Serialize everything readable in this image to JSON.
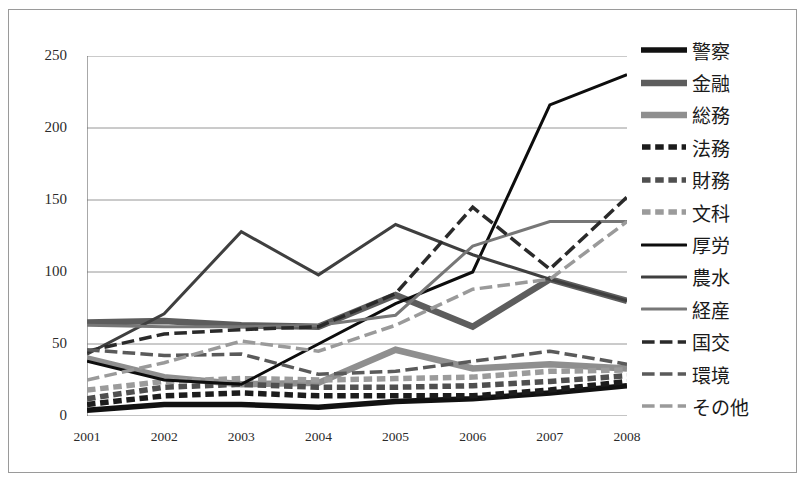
{
  "chart_data": {
    "type": "line",
    "title": "",
    "xlabel": "",
    "ylabel": "",
    "categories": [
      "2001",
      "2002",
      "2003",
      "2004",
      "2005",
      "2006",
      "2007",
      "2008"
    ],
    "ylim": [
      0,
      250
    ],
    "yticks": [
      0,
      50,
      100,
      150,
      200,
      250
    ],
    "grid": true,
    "legend_position": "right",
    "series": [
      {
        "name": "警察",
        "values": [
          4,
          8,
          8,
          6,
          10,
          12,
          16,
          21
        ],
        "color": "#111111",
        "width": 5.5,
        "dash": "solid"
      },
      {
        "name": "金融",
        "values": [
          65,
          66,
          63,
          62,
          84,
          62,
          95,
          80
        ],
        "color": "#5d5d5d",
        "width": 6.5,
        "dash": "solid"
      },
      {
        "name": "総務",
        "values": [
          40,
          27,
          22,
          23,
          46,
          33,
          36,
          33
        ],
        "color": "#8f8f8f",
        "width": 6.5,
        "dash": "solid"
      },
      {
        "name": "法務",
        "values": [
          8,
          14,
          16,
          14,
          14,
          14,
          18,
          24
        ],
        "color": "#1c1c1c",
        "width": 5.5,
        "dash": "dashed"
      },
      {
        "name": "財務",
        "values": [
          12,
          20,
          22,
          20,
          20,
          21,
          24,
          28
        ],
        "color": "#4f4f4f",
        "width": 5.5,
        "dash": "dashed"
      },
      {
        "name": "文科",
        "values": [
          18,
          24,
          26,
          25,
          26,
          27,
          31,
          32
        ],
        "color": "#9b9b9b",
        "width": 5.5,
        "dash": "dashed"
      },
      {
        "name": "厚労",
        "values": [
          38,
          25,
          22,
          50,
          78,
          100,
          216,
          237
        ],
        "color": "#0d0d0d",
        "width": 3.0,
        "dash": "solid"
      },
      {
        "name": "農水",
        "values": [
          43,
          71,
          128,
          98,
          133,
          112,
          95,
          80
        ],
        "color": "#3f3f3f",
        "width": 3.0,
        "dash": "solid"
      },
      {
        "name": "経産",
        "values": [
          63,
          62,
          62,
          63,
          70,
          118,
          135,
          135
        ],
        "color": "#777777",
        "width": 3.0,
        "dash": "solid"
      },
      {
        "name": "国交",
        "values": [
          45,
          57,
          60,
          62,
          85,
          145,
          102,
          152
        ],
        "color": "#2a2a2a",
        "width": 3.5,
        "dash": "longdash"
      },
      {
        "name": "環境",
        "values": [
          46,
          42,
          43,
          29,
          31,
          38,
          45,
          36
        ],
        "color": "#5a5a5a",
        "width": 3.5,
        "dash": "longdash"
      },
      {
        "name": "その他",
        "values": [
          25,
          37,
          52,
          45,
          63,
          88,
          95,
          135
        ],
        "color": "#9a9a9a",
        "width": 3.5,
        "dash": "longdash"
      }
    ]
  },
  "legend": {
    "items": [
      {
        "label": "警察"
      },
      {
        "label": "金融"
      },
      {
        "label": "総務"
      },
      {
        "label": "法務"
      },
      {
        "label": "財務"
      },
      {
        "label": "文科"
      },
      {
        "label": "厚労"
      },
      {
        "label": "農水"
      },
      {
        "label": "経産"
      },
      {
        "label": "国交"
      },
      {
        "label": "環境"
      },
      {
        "label": "その他"
      }
    ]
  },
  "axes": {
    "y_tick_labels": [
      "250",
      "200",
      "150",
      "100",
      "50",
      "0"
    ],
    "x_tick_labels": [
      "2001",
      "2002",
      "2003",
      "2004",
      "2005",
      "2006",
      "2007",
      "2008"
    ]
  },
  "colors": {
    "frame": "#9a9a9a",
    "grid": "#8a8a8a",
    "axis": "#6e6e6e",
    "text": "#2b2b2b"
  }
}
